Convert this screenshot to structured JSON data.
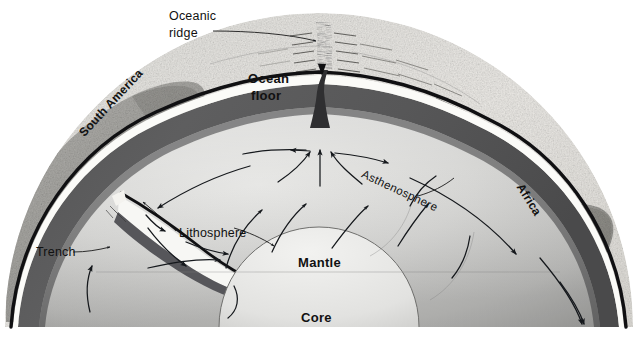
{
  "figure": {
    "background_color": "#ffffff",
    "width": 638,
    "height": 341
  },
  "labels": {
    "oceanic_ridge_line1": "Oceanic",
    "oceanic_ridge_line2": "ridge",
    "ocean_floor_line1": "Ocean",
    "ocean_floor_line2": "floor",
    "south_america": "South America",
    "africa": "Africa",
    "asthenosphere": "Asthenosphere",
    "lithosphere": "Lithosphere",
    "trench": "Trench",
    "mantle": "Mantle",
    "core": "Core"
  },
  "colors": {
    "background": "#ffffff",
    "ocean_floor_light": "#e9e8e4",
    "ocean_floor_mid": "#d3d2cd",
    "continent_gray": "#a9a8a4",
    "continent_gray_dark": "#8e8d89",
    "asthenosphere": "#59595a",
    "asthenosphere_dark": "#48484a",
    "mantle_light": "#d8d8d6",
    "mantle_mid": "#bdbdbb",
    "mantle_dark": "#9b9b99",
    "lithosphere_white": "#fbfbf8",
    "crust_black": "#101012",
    "core_fill": "#eeeeec",
    "label_text": "#111111",
    "leader_line": "#1a1a1a"
  },
  "structure": {
    "layers": [
      {
        "name": "crust",
        "description": "thin black outer line"
      },
      {
        "name": "lithosphere",
        "description": "white band beneath crust"
      },
      {
        "name": "asthenosphere",
        "description": "dark gray band beneath lithosphere"
      },
      {
        "name": "mantle",
        "description": "large light gray gradient interior"
      },
      {
        "name": "core",
        "description": "pale dome at bottom center"
      }
    ],
    "features": [
      "oceanic ridge at top center with diverging arrows",
      "trench and subduction zone on the left beneath South America",
      "convection arrows rising in the mantle",
      "spreading arrows pointing left and right away from the ridge"
    ]
  }
}
